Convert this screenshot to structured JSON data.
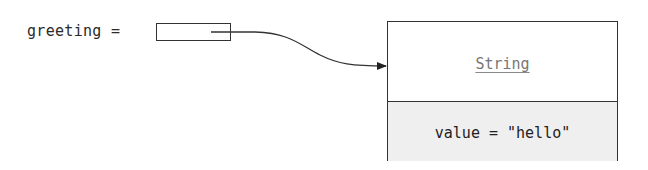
{
  "diagram": {
    "variable": {
      "name": "greeting",
      "label": "greeting ="
    },
    "reference": {
      "from": "greeting",
      "to": "String"
    },
    "object": {
      "class_name": "String",
      "fields": [
        {
          "label": "value = \"hello\""
        }
      ]
    }
  },
  "colors": {
    "stroke": "#333333",
    "class_name_text": "#777777",
    "fields_background": "#efefef"
  }
}
